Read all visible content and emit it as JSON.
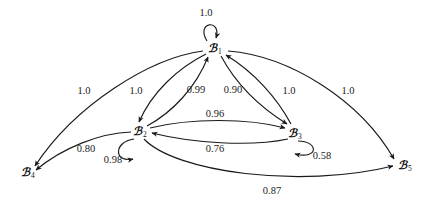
{
  "figure": {
    "type": "directed-weighted-graph",
    "background_color": "#ffffff",
    "stroke_color": "#1a1a1a",
    "width": 434,
    "height": 208
  },
  "nodes": [
    {
      "id": "B1",
      "symbol": "ℬ",
      "subscript": "1",
      "label": "ℬ₁",
      "x": 215,
      "y": 48
    },
    {
      "id": "B2",
      "symbol": "ℬ",
      "subscript": "2",
      "label": "ℬ₂",
      "x": 140,
      "y": 131
    },
    {
      "id": "B3",
      "symbol": "ℬ",
      "subscript": "3",
      "label": "ℬ₃",
      "x": 295,
      "y": 133
    },
    {
      "id": "B4",
      "symbol": "ℬ",
      "subscript": "4",
      "label": "ℬ₄",
      "x": 28,
      "y": 172
    },
    {
      "id": "B5",
      "symbol": "ℬ",
      "subscript": "5",
      "label": "ℬ₅",
      "x": 405,
      "y": 165
    }
  ],
  "edges": [
    {
      "id": "e-b1-b1",
      "from": "B1",
      "to": "B1",
      "weight": "1.0",
      "self_loop": true,
      "label_x": 206,
      "label_y": 12
    },
    {
      "id": "e-b2-b2",
      "from": "B2",
      "to": "B2",
      "weight": "0.98",
      "self_loop": true,
      "label_x": 113,
      "label_y": 159
    },
    {
      "id": "e-b3-b3",
      "from": "B3",
      "to": "B3",
      "weight": "0.58",
      "self_loop": true,
      "label_x": 322,
      "label_y": 155
    },
    {
      "id": "e-b1-b4",
      "from": "B1",
      "to": "B4",
      "weight": "1.0",
      "self_loop": false,
      "label_x": 84,
      "label_y": 90
    },
    {
      "id": "e-b1-b2",
      "from": "B1",
      "to": "B2",
      "weight": "1.0",
      "self_loop": false,
      "label_x": 136,
      "label_y": 90
    },
    {
      "id": "e-b2-b1",
      "from": "B2",
      "to": "B1",
      "weight": "0.99",
      "self_loop": false,
      "label_x": 196,
      "label_y": 89
    },
    {
      "id": "e-b1-b3",
      "from": "B1",
      "to": "B3",
      "weight": "0.90",
      "self_loop": false,
      "label_x": 233,
      "label_y": 89
    },
    {
      "id": "e-b3-b1",
      "from": "B3",
      "to": "B1",
      "weight": "1.0",
      "self_loop": false,
      "label_x": 289,
      "label_y": 90
    },
    {
      "id": "e-b1-b5",
      "from": "B1",
      "to": "B5",
      "weight": "1.0",
      "self_loop": false,
      "label_x": 348,
      "label_y": 90
    },
    {
      "id": "e-b2-b3",
      "from": "B2",
      "to": "B3",
      "weight": "0.96",
      "self_loop": false,
      "label_x": 215,
      "label_y": 113
    },
    {
      "id": "e-b3-b2",
      "from": "B3",
      "to": "B2",
      "weight": "0.76",
      "self_loop": false,
      "label_x": 215,
      "label_y": 148
    },
    {
      "id": "e-b2-b4",
      "from": "B2",
      "to": "B4",
      "weight": "0.80",
      "self_loop": false,
      "label_x": 86,
      "label_y": 148
    },
    {
      "id": "e-b2-b5",
      "from": "B2",
      "to": "B5",
      "weight": "0.87",
      "self_loop": false,
      "label_x": 272,
      "label_y": 190
    }
  ]
}
